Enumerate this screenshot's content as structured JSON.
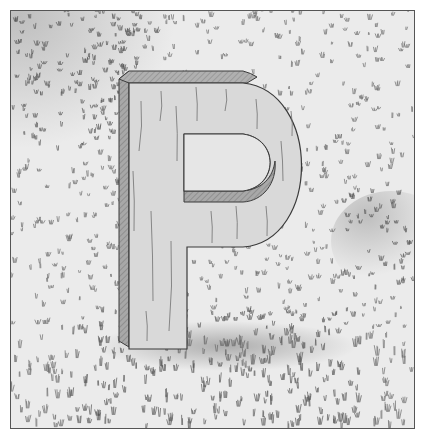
{
  "illustration": {
    "subject": "Wooden letter P standing on grass",
    "letter": "P",
    "colors": {
      "paper": "#ffffff",
      "grass_background": "#ebebeb",
      "grass_stroke": "#6a6a6a",
      "dense_grass_stroke": "#555555",
      "wood_face": "#d9d9d9",
      "wood_side": "#a8a8a8",
      "wood_grain": "#707070",
      "outline": "#3a3a3a",
      "shadow": "#8e8e8e"
    }
  }
}
